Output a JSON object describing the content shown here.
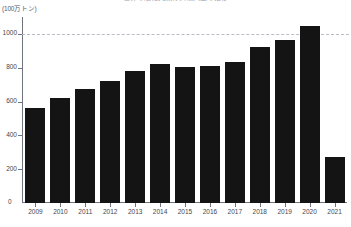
{
  "chart_data": {
    "type": "bar",
    "title": "世界の液化天然ガス輸入量の推移",
    "unit_label": "(100万トン)",
    "ylabel": "",
    "xlabel": "",
    "categories": [
      "2009",
      "2010",
      "2011",
      "2012",
      "2013",
      "2014",
      "2015",
      "2016",
      "2017",
      "2018",
      "2019",
      "2020",
      "2021"
    ],
    "values": [
      560,
      620,
      675,
      720,
      780,
      820,
      805,
      810,
      835,
      925,
      965,
      1045,
      270
    ],
    "ylim": [
      0,
      1100
    ],
    "yticks": [
      0,
      200,
      400,
      600,
      800,
      1000
    ],
    "ytick_labels": [
      "0",
      "200",
      "400",
      "600",
      "800",
      "1000"
    ],
    "gridlines": [
      1000
    ],
    "grid": true,
    "legend": false,
    "bar_color": "#141414",
    "axis_color": "#6f7480",
    "grid_color": "#b9bcc6"
  }
}
